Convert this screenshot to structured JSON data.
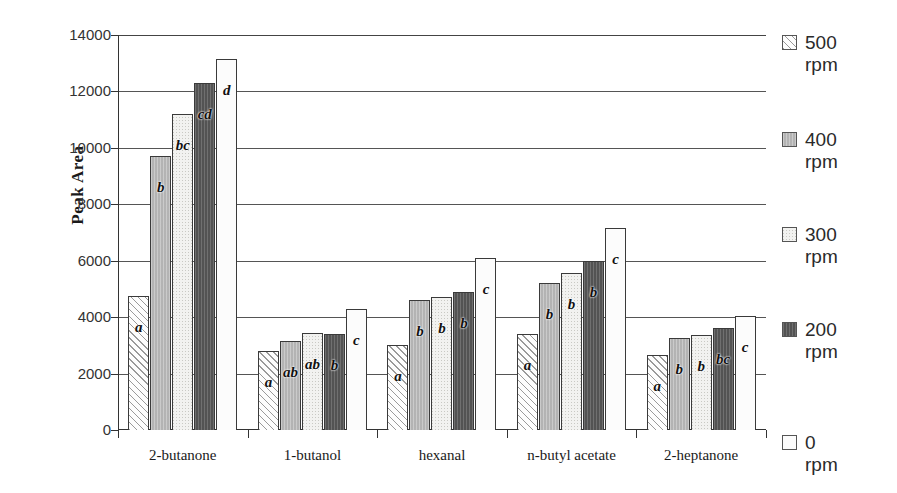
{
  "chart_data": {
    "type": "bar",
    "title": "",
    "xlabel": "",
    "ylabel": "Peak Area",
    "ylim": [
      0,
      14000
    ],
    "ytick_values": [
      0,
      2000,
      4000,
      6000,
      8000,
      10000,
      12000,
      14000
    ],
    "ytick_labels": [
      "0",
      "2000",
      "4000",
      "6000",
      "8000",
      "10000",
      "12000",
      "14000"
    ],
    "grid": true,
    "legend_position": "right",
    "categories": [
      "2-butanone",
      "1-butanol",
      "hexanal",
      "n-butyl acetate",
      "2-heptanone"
    ],
    "series": [
      {
        "name": "500 rpm",
        "pattern": "white-diagonal-hatch",
        "values": [
          4750,
          2800,
          3000,
          3400,
          2650
        ],
        "annotations": [
          "a",
          "a",
          "a",
          "a",
          "a"
        ]
      },
      {
        "name": "400 rpm",
        "pattern": "medium-gray",
        "values": [
          9700,
          3150,
          4600,
          5200,
          3250
        ],
        "annotations": [
          "b",
          "ab",
          "b",
          "b",
          "b"
        ]
      },
      {
        "name": "300 rpm",
        "pattern": "light-speckle",
        "values": [
          11200,
          3450,
          4700,
          5550,
          3350
        ],
        "annotations": [
          "bc",
          "ab",
          "b",
          "b",
          "b"
        ]
      },
      {
        "name": "200 rpm",
        "pattern": "dark-gray",
        "values": [
          12300,
          3400,
          4900,
          6000,
          3600
        ],
        "annotations": [
          "cd",
          "b",
          "b",
          "b",
          "bc"
        ]
      },
      {
        "name": "0 rpm",
        "pattern": "white",
        "values": [
          13150,
          4300,
          6100,
          7150,
          4050
        ],
        "annotations": [
          "d",
          "c",
          "c",
          "c",
          "c"
        ]
      }
    ],
    "legend_entries": [
      {
        "label": "500\nrpm",
        "swatch": "white-diagonal-hatch"
      },
      {
        "label": "400\nrpm",
        "swatch": "medium-gray"
      },
      {
        "label": "300\nrpm",
        "swatch": "light-speckle"
      },
      {
        "label": "200\nrpm",
        "swatch": "dark-gray"
      },
      {
        "label": "0\nrpm",
        "swatch": "white"
      }
    ]
  },
  "colors": {
    "axis": "#333333",
    "gridline": "#555555",
    "text": "#1a1a1a",
    "series_500": "#fdfdfd",
    "series_400": "#b9b9b9",
    "series_300": "#f2f2f0",
    "series_200": "#5c5c5c",
    "series_0": "#fcfcfc"
  }
}
